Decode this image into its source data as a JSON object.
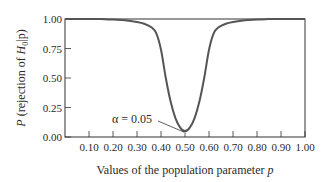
{
  "chart_data": {
    "type": "line",
    "title": "",
    "xlabel": "Values of the population parameter p",
    "ylabel": "P (rejection of H0|p)",
    "xlim": [
      0.0,
      1.0
    ],
    "ylim": [
      0.0,
      1.0
    ],
    "x_ticks": [
      "0.10",
      "0.20",
      "0.30",
      "0.40",
      "0.50",
      "0.60",
      "0.70",
      "0.80",
      "0.90",
      "1.00"
    ],
    "y_ticks": [
      "0.00",
      "0.25",
      "0.50",
      "0.75",
      "1.00"
    ],
    "grid": false,
    "legend": null,
    "series": [
      {
        "name": "Power curve",
        "x": [
          0.0,
          0.05,
          0.1,
          0.15,
          0.2,
          0.25,
          0.3,
          0.33,
          0.36,
          0.38,
          0.4,
          0.42,
          0.44,
          0.46,
          0.48,
          0.5,
          0.52,
          0.54,
          0.56,
          0.58,
          0.6,
          0.62,
          0.64,
          0.67,
          0.7,
          0.75,
          0.8,
          0.85,
          0.9,
          0.95,
          1.0
        ],
        "y": [
          1.0,
          1.0,
          1.0,
          1.0,
          0.995,
          0.99,
          0.975,
          0.96,
          0.93,
          0.88,
          0.74,
          0.5,
          0.3,
          0.16,
          0.08,
          0.05,
          0.08,
          0.16,
          0.3,
          0.5,
          0.74,
          0.88,
          0.93,
          0.96,
          0.975,
          0.99,
          0.995,
          1.0,
          1.0,
          1.0,
          1.0
        ]
      }
    ],
    "annotations": [
      {
        "text": "α = 0.05",
        "x": 0.5,
        "y": 0.05
      }
    ]
  },
  "labels": {
    "xlabel_main": "Values of the population parameter ",
    "xlabel_var": "p",
    "ylabel_P": "P",
    "ylabel_mid": " (rejection of ",
    "ylabel_H": "H",
    "ylabel_sub": "0",
    "ylabel_end": "|p)",
    "alpha": "α = 0.05"
  },
  "colors": {
    "curve": "#555555",
    "axis": "#333333",
    "text": "#2a2a2a"
  }
}
